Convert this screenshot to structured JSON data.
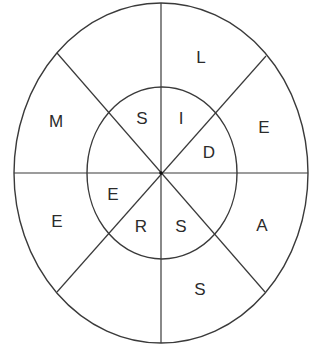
{
  "diagram": {
    "type": "letter-wheel",
    "outer_ring": {
      "letters": [
        {
          "sector": "N-NE",
          "letter": "L"
        },
        {
          "sector": "NE-E",
          "letter": "E"
        },
        {
          "sector": "E-SE",
          "letter": "A"
        },
        {
          "sector": "SE-S",
          "letter": "S"
        },
        {
          "sector": "S-SW",
          "letter": ""
        },
        {
          "sector": "SW-W",
          "letter": "E"
        },
        {
          "sector": "W-NW",
          "letter": "M"
        },
        {
          "sector": "NW-N",
          "letter": ""
        }
      ]
    },
    "inner_ring": {
      "letters": [
        {
          "sector": "N-NE",
          "letter": "I"
        },
        {
          "sector": "NE-E",
          "letter": "D"
        },
        {
          "sector": "E-SE",
          "letter": ""
        },
        {
          "sector": "SE-S",
          "letter": "S"
        },
        {
          "sector": "S-SW",
          "letter": "R"
        },
        {
          "sector": "SW-W",
          "letter": "E"
        },
        {
          "sector": "W-NW",
          "letter": ""
        },
        {
          "sector": "NW-N",
          "letter": "S"
        }
      ]
    },
    "colors": {
      "stroke": "#3a3a3a",
      "text": "#2b2b2b",
      "background": "#ffffff"
    }
  }
}
